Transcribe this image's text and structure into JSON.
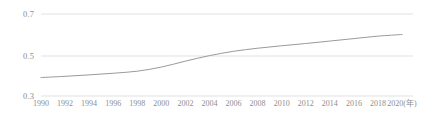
{
  "chart_data": {
    "type": "line",
    "title": "",
    "subtitle": "",
    "xlabel": "(年)",
    "ylabel": "",
    "grid": true,
    "legend": "none",
    "xlim": [
      1990,
      2020
    ],
    "ylim": [
      0.3,
      0.7
    ],
    "ytick_labels": [
      "0.7",
      "0.5",
      "0.3"
    ],
    "ytick_values": [
      0.7,
      0.5,
      0.3
    ],
    "xtick_labels": [
      "1990",
      "1992",
      "1994",
      "1996",
      "1998",
      "2000",
      "2002",
      "2004",
      "2006",
      "2008",
      "2010",
      "2012",
      "2014",
      "2016",
      "2018",
      "2020(年)"
    ],
    "x": [
      1990,
      1992,
      1994,
      1996,
      1998,
      2000,
      2002,
      2004,
      2006,
      2008,
      2010,
      2012,
      2014,
      2016,
      2018,
      2020
    ],
    "series": [
      {
        "name": "",
        "color": "#9a9a9a",
        "values": [
          0.39,
          0.396,
          0.403,
          0.411,
          0.421,
          0.441,
          0.47,
          0.497,
          0.518,
          0.533,
          0.545,
          0.556,
          0.568,
          0.58,
          0.592,
          0.6
        ]
      }
    ]
  },
  "style": {
    "grid_color": "#d9d9d9",
    "line_color": "#9a9a9a",
    "tick_text_color": "#8d8d8d",
    "background": "#ffffff"
  }
}
